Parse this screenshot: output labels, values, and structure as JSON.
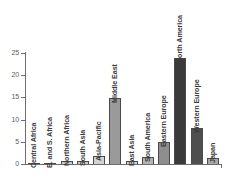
{
  "chart_data": {
    "type": "bar",
    "title": "",
    "subtitle": "",
    "xlabel": "",
    "ylabel": "",
    "ylim": [
      0,
      25
    ],
    "yticks": [
      0,
      5,
      10,
      15,
      20,
      25
    ],
    "grid": false,
    "legend": false,
    "categories": [
      "Central Africa",
      "E. and S. Africa",
      "Northern Africa",
      "South Asia",
      "Asia-Pacific",
      "Middle East",
      "East Asia",
      "South America",
      "Eastern Europe",
      "North America",
      "Western Europe",
      "Japan"
    ],
    "values": [
      0.05,
      0.1,
      0.6,
      0.7,
      1.7,
      14.9,
      0.7,
      1.5,
      5.0,
      23.8,
      8.0,
      1.3
    ],
    "bar_colors": [
      "#d9d9d9",
      "#d9d9d9",
      "#cfcfcf",
      "#cdcdcd",
      "#d2d2d2",
      "#9a9a9a",
      "#d2d2d2",
      "#b4b4b4",
      "#8e8e8e",
      "#3a3a3a",
      "#4f4f4f",
      "#a8a8a8"
    ]
  },
  "axis": {
    "tick_labels": [
      "0",
      "5",
      "10",
      "15",
      "20",
      "25"
    ],
    "tick_color": "#5c5c5c",
    "axis_color": "#6e6e6e"
  },
  "style": {
    "background": "#ffffff",
    "bar_border": "#4a4a4a",
    "label_color": "#3c3c3c"
  }
}
